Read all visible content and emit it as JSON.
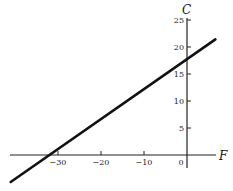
{
  "chart_data": {
    "type": "line",
    "title": "",
    "xlabel": "F",
    "ylabel": "C",
    "xlim": [
      -42,
      9
    ],
    "ylim": [
      -5,
      32
    ],
    "grid": false,
    "legend": null,
    "x_ticks": [
      -30,
      -20,
      -10,
      0
    ],
    "x_tick_labels": [
      "−30",
      "−20",
      "−10",
      "0"
    ],
    "y_ticks": [
      5,
      10,
      15,
      20,
      25
    ],
    "y_tick_labels": [
      "5",
      "10",
      "15",
      "20",
      "25"
    ],
    "series": [
      {
        "name": "C = 5/9 (F + 32)",
        "x": [
          -41,
          6.6
        ],
        "y": [
          -5,
          21.4
        ],
        "color": "#111111"
      }
    ],
    "annotations": []
  }
}
